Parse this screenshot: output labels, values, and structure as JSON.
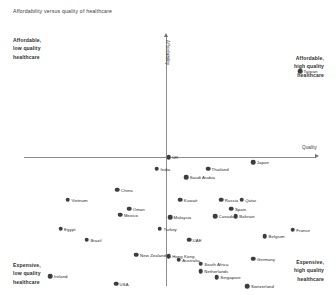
{
  "chart_data": {
    "type": "scatter",
    "title": "Affordability versus quality of healthcare",
    "xlabel": "Quality",
    "ylabel": "Affordability",
    "grid": false,
    "legend": false,
    "axis_style": "quadrant-crosshair-with-arrows",
    "xlim": [
      0,
      100
    ],
    "ylim": [
      0,
      100
    ],
    "origin_note": "Axes cross near the plot centre; no numeric tick labels are shown.",
    "quadrant_labels": {
      "top_left": "Affordable,\nlow quality\nhealthcare",
      "top_right": "Affordable,\nhigh quality\nhealthcare",
      "bottom_left": "Expensive,\nlow quality\nhealthcare",
      "bottom_right": "Expensive,\nhigh quality\nhealthcare"
    },
    "marker_color": "#3d3d3d",
    "axis_color": "#8c8c8c",
    "points": [
      {
        "label": "Taiwan",
        "x": 94.5,
        "y": 86.0
      },
      {
        "label": "UK",
        "x": 49.5,
        "y": 51.5
      },
      {
        "label": "India",
        "x": 45.5,
        "y": 47.0
      },
      {
        "label": "Thailand",
        "x": 63.0,
        "y": 47.0
      },
      {
        "label": "Saudi Arabia",
        "x": 55.5,
        "y": 43.5
      },
      {
        "label": "Japan",
        "x": 78.5,
        "y": 49.5
      },
      {
        "label": "China",
        "x": 32.0,
        "y": 38.5
      },
      {
        "label": "Vietnam",
        "x": 15.0,
        "y": 34.5
      },
      {
        "label": "Oman",
        "x": 36.0,
        "y": 31.0
      },
      {
        "label": "Mexico",
        "x": 33.0,
        "y": 28.5
      },
      {
        "label": "Kuwait",
        "x": 53.5,
        "y": 34.5
      },
      {
        "label": "Malaysia",
        "x": 50.0,
        "y": 27.5
      },
      {
        "label": "Russia",
        "x": 67.5,
        "y": 34.5
      },
      {
        "label": "Qatar",
        "x": 74.5,
        "y": 34.5
      },
      {
        "label": "Spain",
        "x": 71.0,
        "y": 31.0
      },
      {
        "label": "Canada",
        "x": 65.5,
        "y": 28.0
      },
      {
        "label": "Bahrain",
        "x": 72.5,
        "y": 28.0
      },
      {
        "label": "Egypt",
        "x": 12.5,
        "y": 23.0
      },
      {
        "label": "Brazil",
        "x": 21.5,
        "y": 18.5
      },
      {
        "label": "Turkey",
        "x": 46.5,
        "y": 23.0
      },
      {
        "label": "UAE",
        "x": 56.5,
        "y": 18.5
      },
      {
        "label": "Belgium",
        "x": 82.5,
        "y": 20.0
      },
      {
        "label": "France",
        "x": 92.0,
        "y": 22.5
      },
      {
        "label": "New Zealand",
        "x": 38.5,
        "y": 12.5
      },
      {
        "label": "Hong Kong",
        "x": 49.5,
        "y": 12.0
      },
      {
        "label": "Australia",
        "x": 53.0,
        "y": 10.5
      },
      {
        "label": "South Africa",
        "x": 60.5,
        "y": 9.0
      },
      {
        "label": "Germany",
        "x": 78.5,
        "y": 11.0
      },
      {
        "label": "Netherlands",
        "x": 60.5,
        "y": 6.0
      },
      {
        "label": "Singapore",
        "x": 66.0,
        "y": 3.5
      },
      {
        "label": "Ireland",
        "x": 9.0,
        "y": 4.0
      },
      {
        "label": "USA",
        "x": 31.5,
        "y": 1.0
      },
      {
        "label": "Switzerland",
        "x": 76.5,
        "y": 0.0
      }
    ]
  }
}
